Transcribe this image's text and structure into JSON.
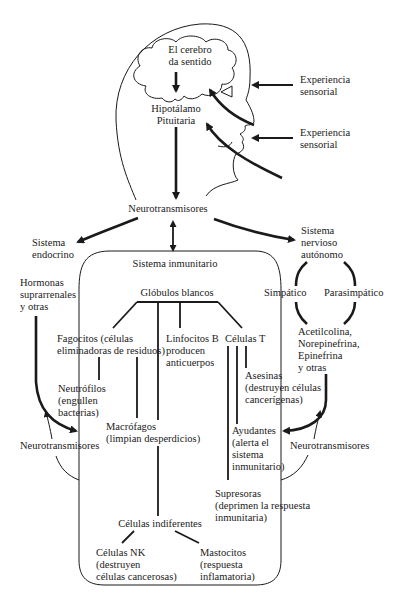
{
  "diagram": {
    "type": "flow-diagram",
    "topic": "mind-body connection: brain, nervous system and immune system",
    "nodes": {
      "brain": [
        "El cerebro",
        "da sentido"
      ],
      "hypothalamus": [
        "Hipotálamo",
        "Pituitaria"
      ],
      "sensory_1": [
        "Experiencia",
        "sensorial"
      ],
      "sensory_2": [
        "Experiencia",
        "sensorial"
      ],
      "neurotransmitters_top": "Neurotransmisores",
      "endocrine": [
        "Sistema",
        "endocrino"
      ],
      "autonomic": [
        "Sistema",
        "nervioso",
        "autónomo"
      ],
      "immune_system": "Sistema inmunitario",
      "hormones": [
        "Hormonas",
        "suprarrenales",
        "y otras"
      ],
      "white_cells": "Glóbulos blancos",
      "sympathetic": "Simpático",
      "parasympathetic": "Parasimpático",
      "phagocytes": [
        "Fagocitos (células",
        "eliminadoras de residuos)"
      ],
      "b_lymphocytes": [
        "Linfocitos B",
        "producen",
        "anticuerpos"
      ],
      "t_cells": "Células T",
      "acetylcholine": [
        "Acetilcolina,",
        "Norepinefrina,",
        "Epinefrina",
        "y otras"
      ],
      "killers": [
        "Asesinas",
        "(destruyen células",
        "cancerígenas)"
      ],
      "neutrophils": [
        "Neutrófilos",
        "(engullen",
        "bacterias)"
      ],
      "macrophages": [
        "Macrófagos",
        "(limpian desperdicios)"
      ],
      "helpers": [
        "Ayudantes",
        "(alerta el",
        "sistema",
        "inmunitario)"
      ],
      "neurotransmitters_left": "Neurotransmisores",
      "neurotransmitters_right": "Neurotransmisores",
      "suppressors": [
        "Supresoras",
        "(deprimen la respuesta",
        "inmunitaria)"
      ],
      "null_cells": "Células indiferentes",
      "nk_cells": [
        "Células NK",
        "(destruyen",
        "células cancerosas)"
      ],
      "mast_cells": [
        "Mastocitos",
        "(respuesta",
        "inflamatoria)"
      ]
    },
    "edges": [
      {
        "from": "sensory_1",
        "to": "brain"
      },
      {
        "from": "sensory_2",
        "to": "brain"
      },
      {
        "from": "brain",
        "to": "hypothalamus"
      },
      {
        "from": "hypothalamus",
        "to": "neurotransmitters_top"
      },
      {
        "from": "neurotransmitters_top",
        "to": "endocrine"
      },
      {
        "from": "neurotransmitters_top",
        "to": "autonomic"
      },
      {
        "from": "neurotransmitters_top",
        "to": "immune_system",
        "bidirectional": true
      },
      {
        "from": "autonomic",
        "to": "sympathetic"
      },
      {
        "from": "autonomic",
        "to": "parasympathetic"
      },
      {
        "from": "sympathetic",
        "to": "acetylcholine"
      },
      {
        "from": "parasympathetic",
        "to": "acetylcholine"
      },
      {
        "from": "hormones",
        "to": "immune_system"
      },
      {
        "from": "acetylcholine",
        "to": "immune_system"
      },
      {
        "from": "white_cells",
        "to": "phagocytes"
      },
      {
        "from": "white_cells",
        "to": "b_lymphocytes"
      },
      {
        "from": "white_cells",
        "to": "t_cells"
      },
      {
        "from": "white_cells",
        "to": "null_cells"
      },
      {
        "from": "phagocytes",
        "to": "neutrophils"
      },
      {
        "from": "phagocytes",
        "to": "macrophages"
      },
      {
        "from": "t_cells",
        "to": "killers"
      },
      {
        "from": "t_cells",
        "to": "helpers"
      },
      {
        "from": "t_cells",
        "to": "suppressors"
      },
      {
        "from": "null_cells",
        "to": "nk_cells"
      },
      {
        "from": "null_cells",
        "to": "mast_cells"
      }
    ],
    "colors": {
      "ink": "#1a1a1a",
      "background": "#ffffff"
    }
  }
}
